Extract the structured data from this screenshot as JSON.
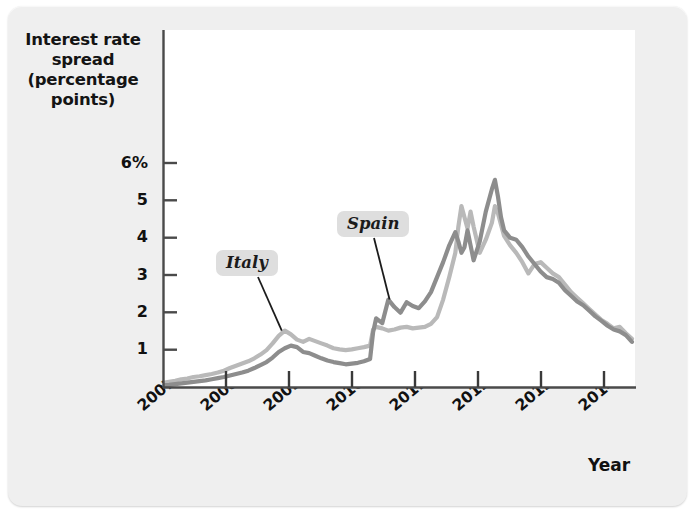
{
  "figure": {
    "background_color": "#efefef",
    "plot_background_color": "#ffffff"
  },
  "chart_data": {
    "type": "line",
    "title": "",
    "subtitle": "",
    "ylabel": "Interest rate spread (percentage points)",
    "ylabel_lines": [
      "Interest rate",
      "spread",
      "(percentage",
      "points)"
    ],
    "xlabel": "Year",
    "ylim": [
      0,
      6.4
    ],
    "xlim": [
      2007.0,
      2014.75
    ],
    "grid": false,
    "legend_position": "inline-annotations",
    "yticks": [
      1,
      2,
      3,
      4,
      5,
      6
    ],
    "ytick_labels": [
      "1",
      "2",
      "3",
      "4",
      "5",
      "6%"
    ],
    "xticks": [
      2007,
      2008,
      2009,
      2010,
      2011,
      2012,
      2013,
      2014
    ],
    "xtick_labels": [
      "2007",
      "2008",
      "2009",
      "2010",
      "2011",
      "2012",
      "2013",
      "2014"
    ],
    "annotations": [
      {
        "text": "Italy",
        "series": "Italy",
        "point_x": 2008.95,
        "point_y": 1.52
      },
      {
        "text": "Spain",
        "series": "Spain",
        "point_x": 2010.72,
        "point_y": 2.35
      }
    ],
    "series": [
      {
        "name": "Italy",
        "color": "#b9b9b9",
        "x": [
          2007.0,
          2007.1,
          2007.2,
          2007.3,
          2007.4,
          2007.5,
          2007.6,
          2007.7,
          2007.8,
          2007.9,
          2008.0,
          2008.1,
          2008.2,
          2008.3,
          2008.4,
          2008.5,
          2008.6,
          2008.7,
          2008.8,
          2008.9,
          2009.0,
          2009.1,
          2009.2,
          2009.3,
          2009.4,
          2009.5,
          2009.6,
          2009.7,
          2009.8,
          2009.9,
          2010.0,
          2010.1,
          2010.2,
          2010.3,
          2010.4,
          2010.45,
          2010.5,
          2010.6,
          2010.7,
          2010.8,
          2010.9,
          2011.0,
          2011.1,
          2011.2,
          2011.3,
          2011.4,
          2011.5,
          2011.6,
          2011.7,
          2011.8,
          2011.85,
          2011.9,
          2011.95,
          2012.0,
          2012.05,
          2012.1,
          2012.2,
          2012.3,
          2012.4,
          2012.45,
          2012.5,
          2012.55,
          2012.6,
          2012.7,
          2012.8,
          2012.9,
          2013.0,
          2013.1,
          2013.2,
          2013.3,
          2013.4,
          2013.5,
          2013.6,
          2013.7,
          2013.8,
          2013.9,
          2014.0,
          2014.1,
          2014.2,
          2014.3,
          2014.4,
          2014.5,
          2014.6,
          2014.7
        ],
        "y": [
          0.12,
          0.15,
          0.18,
          0.22,
          0.24,
          0.28,
          0.3,
          0.33,
          0.36,
          0.4,
          0.45,
          0.52,
          0.58,
          0.64,
          0.7,
          0.78,
          0.88,
          1.0,
          1.18,
          1.38,
          1.52,
          1.42,
          1.28,
          1.22,
          1.3,
          1.24,
          1.18,
          1.12,
          1.05,
          1.02,
          1.0,
          1.02,
          1.05,
          1.08,
          1.12,
          1.55,
          1.62,
          1.58,
          1.52,
          1.55,
          1.6,
          1.62,
          1.58,
          1.6,
          1.62,
          1.7,
          1.88,
          2.35,
          2.95,
          3.6,
          4.3,
          4.85,
          4.55,
          4.25,
          4.7,
          4.3,
          3.6,
          3.95,
          4.4,
          4.85,
          4.65,
          4.35,
          4.05,
          3.8,
          3.6,
          3.35,
          3.05,
          3.3,
          3.35,
          3.2,
          3.05,
          2.95,
          2.75,
          2.55,
          2.4,
          2.25,
          2.1,
          1.95,
          1.8,
          1.7,
          1.58,
          1.62,
          1.45,
          1.3
        ]
      },
      {
        "name": "Spain",
        "color": "#8d8d8d",
        "x": [
          2007.0,
          2007.1,
          2007.2,
          2007.3,
          2007.4,
          2007.5,
          2007.6,
          2007.7,
          2007.8,
          2007.9,
          2008.0,
          2008.1,
          2008.2,
          2008.3,
          2008.4,
          2008.5,
          2008.6,
          2008.7,
          2008.8,
          2008.9,
          2009.0,
          2009.1,
          2009.2,
          2009.3,
          2009.4,
          2009.5,
          2009.6,
          2009.7,
          2009.8,
          2009.9,
          2010.0,
          2010.1,
          2010.2,
          2010.3,
          2010.4,
          2010.45,
          2010.5,
          2010.6,
          2010.7,
          2010.8,
          2010.9,
          2011.0,
          2011.1,
          2011.2,
          2011.3,
          2011.4,
          2011.5,
          2011.6,
          2011.7,
          2011.8,
          2011.85,
          2011.9,
          2011.95,
          2012.0,
          2012.05,
          2012.1,
          2012.2,
          2012.3,
          2012.4,
          2012.45,
          2012.5,
          2012.55,
          2012.6,
          2012.7,
          2012.8,
          2012.9,
          2013.0,
          2013.1,
          2013.2,
          2013.3,
          2013.4,
          2013.5,
          2013.6,
          2013.7,
          2013.8,
          2013.9,
          2014.0,
          2014.1,
          2014.2,
          2014.3,
          2014.4,
          2014.5,
          2014.6,
          2014.7
        ],
        "y": [
          0.06,
          0.07,
          0.09,
          0.11,
          0.13,
          0.15,
          0.17,
          0.19,
          0.22,
          0.25,
          0.28,
          0.32,
          0.36,
          0.4,
          0.45,
          0.52,
          0.6,
          0.68,
          0.8,
          0.95,
          1.05,
          1.12,
          1.08,
          0.95,
          0.92,
          0.85,
          0.78,
          0.72,
          0.68,
          0.65,
          0.62,
          0.64,
          0.66,
          0.7,
          0.76,
          1.48,
          1.85,
          1.72,
          2.35,
          2.15,
          2.0,
          2.28,
          2.18,
          2.12,
          2.3,
          2.55,
          2.95,
          3.35,
          3.8,
          4.15,
          3.9,
          3.6,
          3.75,
          4.2,
          3.8,
          3.4,
          3.9,
          4.7,
          5.3,
          5.55,
          5.1,
          4.55,
          4.2,
          4.0,
          3.95,
          3.75,
          3.5,
          3.3,
          3.1,
          2.95,
          2.9,
          2.8,
          2.6,
          2.45,
          2.3,
          2.2,
          2.05,
          1.9,
          1.78,
          1.65,
          1.55,
          1.5,
          1.4,
          1.22
        ]
      }
    ]
  }
}
